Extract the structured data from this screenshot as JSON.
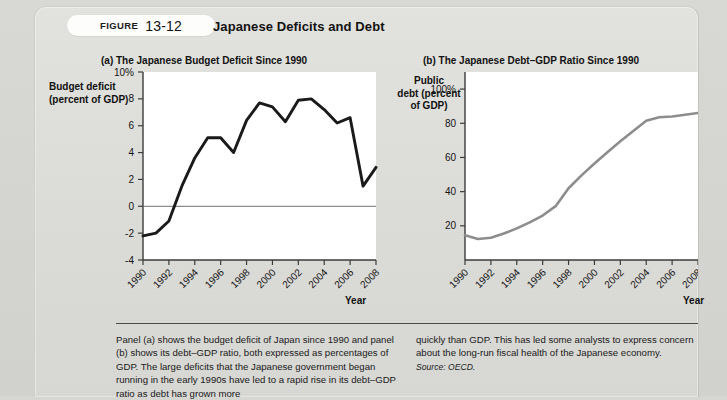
{
  "figure": {
    "keyword": "FIGURE",
    "number": "13-12",
    "title": "Japanese Deficits and Debt"
  },
  "panel_a": {
    "title": "(a) The Japanese Budget Deficit Since 1990",
    "ylabel_line1": "Budget deficit",
    "ylabel_line2": "(percent of GDP)",
    "xlabel": "Year"
  },
  "panel_b": {
    "title": "(b) The Japanese Debt–GDP Ratio Since 1990",
    "ylabel_line1": "Public",
    "ylabel_line2": "debt (percent",
    "ylabel_line3": "of GDP)",
    "xlabel": "Year"
  },
  "caption": {
    "left": "Panel (a) shows the budget deficit of Japan since 1990 and panel (b) shows its debt–GDP ratio, both expressed as percentages of GDP. The large deficits that the Japanese government began running in the early 1990s have led to a rapid rise in its debt–GDP ratio as debt has grown more",
    "right": "quickly than GDP. This has led some analysts to express concern about the long-run fiscal health of the Japanese economy.",
    "source": "Source: OECD."
  },
  "colors": {
    "line_a": "#1a1a1a",
    "line_b": "#8d8d8d",
    "axis": "#3b3b3b",
    "zero_line": "#6f6f6f",
    "plot_bg": "#ffffff",
    "card_bg": "#dededa"
  },
  "chart_data": [
    {
      "id": "panel-a",
      "type": "line",
      "title": "(a) The Japanese Budget Deficit Since 1990",
      "xlabel": "Year",
      "ylabel": "Budget deficit (percent of GDP)",
      "xlim": [
        1990,
        2008
      ],
      "ylim": [
        -4,
        10
      ],
      "yticks": [
        -4,
        -2,
        0,
        2,
        4,
        6,
        8,
        10
      ],
      "ytick_labels": [
        "-4",
        "-2",
        "0",
        "2",
        "4",
        "6",
        "8",
        "10%"
      ],
      "xticks": [
        1990,
        1992,
        1994,
        1996,
        1998,
        2000,
        2002,
        2004,
        2006,
        2008
      ],
      "xtick_labels": [
        "1990",
        "1992",
        "1994",
        "1996",
        "1998",
        "2000",
        "2002",
        "2004",
        "2006",
        "2008"
      ],
      "grid": false,
      "zero_line": true,
      "legend": "none",
      "series": [
        {
          "name": "Budget deficit (percent of GDP)",
          "color": "#1a1a1a",
          "x": [
            1990,
            1991,
            1992,
            1993,
            1994,
            1995,
            1996,
            1997,
            1998,
            1999,
            2000,
            2001,
            2002,
            2003,
            2004,
            2005,
            2006,
            2007,
            2008
          ],
          "values": [
            -2.2,
            -2.0,
            -1.1,
            1.5,
            3.6,
            5.1,
            5.1,
            4.0,
            6.4,
            7.7,
            7.4,
            6.3,
            7.9,
            8.0,
            7.2,
            6.2,
            6.6,
            1.5,
            2.9
          ]
        }
      ]
    },
    {
      "id": "panel-b",
      "type": "line",
      "title": "(b) The Japanese Debt–GDP Ratio Since 1990",
      "xlabel": "Year",
      "ylabel": "Public debt (percent of GDP)",
      "xlim": [
        1990,
        2008
      ],
      "ylim": [
        0,
        110
      ],
      "yticks": [
        20,
        40,
        60,
        80,
        100
      ],
      "ytick_labels": [
        "20",
        "40",
        "60",
        "80",
        "100%"
      ],
      "xticks": [
        1990,
        1992,
        1994,
        1996,
        1998,
        2000,
        2002,
        2004,
        2006,
        2008
      ],
      "xtick_labels": [
        "1990",
        "1992",
        "1994",
        "1996",
        "1998",
        "2000",
        "2002",
        "2004",
        "2006",
        "2008"
      ],
      "grid": false,
      "legend": "none",
      "series": [
        {
          "name": "Public debt (percent of GDP)",
          "color": "#8d8d8d",
          "x": [
            1990,
            1991,
            1992,
            1993,
            1994,
            1995,
            1996,
            1997,
            1998,
            1999,
            2000,
            2001,
            2002,
            2003,
            2004,
            2005,
            2006,
            2007,
            2008
          ],
          "values": [
            14.5,
            12.3,
            13.0,
            15.5,
            18.5,
            22.0,
            26.0,
            31.5,
            42.0,
            49.5,
            56.5,
            63.0,
            69.5,
            75.5,
            81.5,
            83.5,
            84.0,
            85.0,
            86.0
          ]
        }
      ]
    }
  ]
}
